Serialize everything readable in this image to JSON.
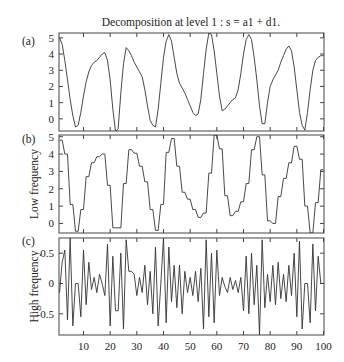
{
  "chart_data": [
    {
      "panel": "(a)",
      "type": "line",
      "title": "Decomposition at level 1 : s = a1 + d1.",
      "xlabel": "",
      "ylabel": "",
      "xlim": [
        1,
        100
      ],
      "ylim": [
        -0.75,
        5.3
      ],
      "yticks": [
        0,
        1,
        2,
        3,
        4,
        5
      ],
      "xticks": [
        10,
        20,
        30,
        40,
        50,
        60,
        70,
        80,
        90,
        100
      ],
      "series": [
        {
          "name": "s",
          "x_start": 1,
          "values": [
            5.0,
            4.6,
            3.6,
            2.4,
            1.2,
            0.2,
            -0.5,
            -0.4,
            0.4,
            1.4,
            2.3,
            2.9,
            3.3,
            3.5,
            3.6,
            3.8,
            4.0,
            4.1,
            3.6,
            2.4,
            0.6,
            -0.8,
            -0.6,
            1.6,
            3.4,
            4.4,
            4.2,
            3.9,
            3.5,
            3.2,
            2.9,
            2.6,
            1.8,
            0.8,
            -0.1,
            -0.4,
            -0.5,
            0.6,
            2.2,
            3.8,
            4.8,
            5.2,
            4.8,
            3.8,
            2.8,
            2.2,
            1.9,
            1.6,
            1.2,
            0.8,
            0.4,
            0.2,
            0.3,
            1.2,
            2.8,
            4.3,
            5.3,
            5.2,
            4.2,
            2.8,
            1.4,
            0.5,
            0.6,
            0.8,
            1.0,
            1.2,
            1.3,
            1.8,
            2.8,
            4.0,
            4.9,
            5.2,
            4.9,
            3.8,
            2.4,
            0.8,
            -0.3,
            -0.3,
            1.0,
            2.0,
            2.4,
            2.7,
            3.0,
            3.5,
            3.9,
            4.3,
            4.5,
            4.2,
            3.2,
            1.8,
            0.4,
            -0.4,
            -0.7,
            0.4,
            1.8,
            3.0,
            3.6,
            3.8,
            3.9,
            3.9
          ]
        }
      ]
    },
    {
      "panel": "(b)",
      "type": "line",
      "title": "",
      "xlabel": "",
      "ylabel": "Low frequency",
      "xlim": [
        1,
        100
      ],
      "ylim": [
        -0.55,
        5.1
      ],
      "yticks": [
        0,
        1,
        2,
        3,
        4,
        5
      ],
      "xticks": [
        10,
        20,
        30,
        40,
        50,
        60,
        70,
        80,
        90,
        100
      ],
      "series": [
        {
          "name": "a1",
          "x_start": 1,
          "values": [
            4.8,
            4.8,
            4.0,
            4.0,
            1.1,
            1.1,
            -0.45,
            -0.45,
            0.8,
            0.8,
            2.7,
            2.7,
            3.5,
            3.5,
            3.85,
            3.85,
            4.0,
            4.0,
            2.2,
            2.2,
            -0.25,
            -0.25,
            -0.25,
            -0.25,
            2.3,
            2.3,
            4.25,
            4.25,
            4.05,
            4.05,
            3.3,
            3.3,
            2.4,
            2.4,
            0.8,
            0.8,
            -0.4,
            -0.4,
            1.1,
            1.1,
            4.1,
            4.1,
            4.9,
            4.9,
            3.3,
            3.3,
            1.8,
            1.8,
            1.4,
            1.4,
            0.8,
            0.8,
            0.35,
            0.35,
            0.6,
            0.6,
            2.9,
            2.9,
            5.1,
            5.1,
            4.3,
            4.3,
            1.6,
            1.6,
            0.45,
            0.45,
            0.7,
            0.7,
            1.25,
            1.25,
            2.3,
            2.3,
            4.25,
            4.25,
            5.0,
            5.0,
            2.8,
            2.8,
            0.15,
            0.15,
            0.0,
            0.0,
            1.55,
            1.55,
            2.6,
            2.6,
            3.5,
            3.5,
            4.45,
            4.45,
            3.7,
            3.7,
            1.0,
            1.0,
            -0.55,
            -0.55,
            1.2,
            1.2,
            3.1,
            3.1
          ]
        }
      ]
    },
    {
      "panel": "(c)",
      "type": "line",
      "title": "",
      "xlabel": "",
      "ylabel": "High frequency",
      "xlim": [
        1,
        100
      ],
      "ylim": [
        -0.85,
        0.75
      ],
      "yticks": [
        -0.5,
        0,
        0.5
      ],
      "xticks": [
        10,
        20,
        30,
        40,
        50,
        60,
        70,
        80,
        90,
        100
      ],
      "xticklabels": [
        "10",
        "20",
        "30",
        "40",
        "50",
        "60",
        "70",
        "80",
        "90",
        "100"
      ],
      "series": [
        {
          "name": "d1",
          "x_start": 1,
          "values": [
            -0.15,
            0.35,
            0.55,
            -0.6,
            0.75,
            -0.7,
            0.0,
            0.0,
            -0.55,
            0.55,
            -0.35,
            0.35,
            -0.1,
            0.1,
            -0.15,
            0.15,
            0.0,
            -0.2,
            0.65,
            -0.7,
            0.45,
            -0.45,
            -0.45,
            0.5,
            -0.75,
            0.72,
            0.2,
            0.2,
            0.15,
            -0.2,
            0.1,
            -0.15,
            0.3,
            -0.35,
            0.2,
            -0.5,
            0.6,
            -0.7,
            0.0,
            0.75,
            -0.65,
            0.6,
            -0.3,
            0.3,
            -0.4,
            0.3,
            -0.5,
            0.2,
            -0.15,
            0.1,
            -0.2,
            0.2,
            -0.3,
            0.25,
            -0.75,
            0.72,
            -0.55,
            0.5,
            -0.65,
            0.55,
            -0.2,
            0.1,
            -0.05,
            -0.15,
            0.1,
            -0.1,
            0.05,
            -0.15,
            0.1,
            -0.45,
            0.45,
            -0.5,
            0.5,
            -0.35,
            0.3,
            -0.85,
            0.72,
            -0.4,
            0.15,
            -0.3,
            0.3,
            -0.35,
            0.35,
            -0.25,
            0.15,
            -0.3,
            0.3,
            -0.2,
            0.5,
            -0.55,
            0.7,
            -0.75,
            0.0,
            0.0,
            -0.65,
            0.65,
            -0.45,
            0.45,
            0.0,
            0.0
          ]
        }
      ]
    }
  ],
  "figure": {
    "title": "Decomposition at level 1 : s = a1 + d1.",
    "panel_labels": [
      "(a)",
      "(b)",
      "(c)"
    ],
    "line_color": "#333333"
  }
}
